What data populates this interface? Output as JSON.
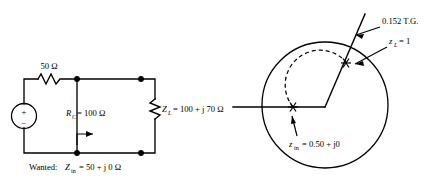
{
  "figure": {
    "circuit": {
      "series_resistor_label": "50 Ω",
      "shunt_resistor_label_main": "R",
      "shunt_resistor_label_sub": "C",
      "shunt_resistor_label_value": "= 100 Ω",
      "load_label_main": "Z",
      "load_label_sub": "L",
      "load_label_value": "= 100 + j 70 Ω",
      "wanted_prefix": "Wanted:",
      "wanted_symbol": "Z",
      "wanted_sub": "in",
      "wanted_value": "= 50 + j 0 Ω",
      "source_plus": "+",
      "source_minus": "−"
    },
    "smith_chart": {
      "tg_label": "0.152 T.G.",
      "zl_label_main": "z",
      "zl_label_sub": "L",
      "zl_label_value": "= 1",
      "zin_label_main": "z",
      "zin_label_sub": "in",
      "zin_label_value": "= 0.50 + j0"
    },
    "colors": {
      "ink": "#000000",
      "background": "#ffffff"
    }
  }
}
